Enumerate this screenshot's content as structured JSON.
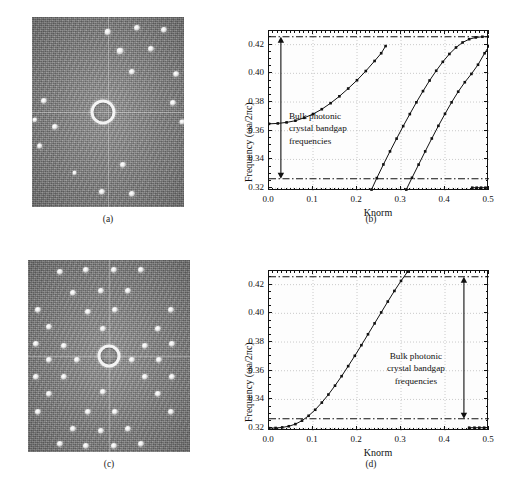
{
  "figure": {
    "panels": [
      {
        "id": "a",
        "caption": "(a)",
        "type": "micrograph"
      },
      {
        "id": "b",
        "caption": "(b)",
        "type": "chart"
      },
      {
        "id": "c",
        "caption": "(c)",
        "type": "micrograph"
      },
      {
        "id": "d",
        "caption": "(d)",
        "type": "chart"
      }
    ]
  },
  "micrograph_a": {
    "label": "(a)",
    "description": "grayscale near-field micrograph with sparse bright spots and central ring",
    "ring": {
      "cx": 47,
      "cy": 50,
      "r": 9.5
    },
    "spots": [
      {
        "x": 50,
        "y": 8,
        "r": 3.2
      },
      {
        "x": 69,
        "y": 6,
        "r": 3.0
      },
      {
        "x": 87,
        "y": 7,
        "r": 3.0
      },
      {
        "x": 58,
        "y": 18,
        "r": 3.2
      },
      {
        "x": 78,
        "y": 17,
        "r": 3.0
      },
      {
        "x": 66,
        "y": 29,
        "r": 3.0
      },
      {
        "x": 95,
        "y": 30,
        "r": 2.8
      },
      {
        "x": 8,
        "y": 44,
        "r": 3.0
      },
      {
        "x": 2,
        "y": 54,
        "r": 2.6
      },
      {
        "x": 15,
        "y": 58,
        "r": 3.0
      },
      {
        "x": 5,
        "y": 68,
        "r": 2.8
      },
      {
        "x": 93,
        "y": 45,
        "r": 3.0
      },
      {
        "x": 99,
        "y": 55,
        "r": 2.6
      },
      {
        "x": 60,
        "y": 78,
        "r": 3.0
      },
      {
        "x": 46,
        "y": 92,
        "r": 3.0
      },
      {
        "x": 66,
        "y": 93,
        "r": 3.0
      },
      {
        "x": 28,
        "y": 82,
        "r": 2.4
      }
    ]
  },
  "micrograph_c": {
    "label": "(c)",
    "description": "grayscale near-field micrograph with dense square lattice of bright spots and central ring",
    "ring": {
      "cx": 50,
      "cy": 50,
      "r": 8.5
    },
    "spots": [
      {
        "x": 20,
        "y": 6,
        "r": 3.0
      },
      {
        "x": 36,
        "y": 5,
        "r": 3.0
      },
      {
        "x": 53,
        "y": 5,
        "r": 3.0
      },
      {
        "x": 70,
        "y": 5,
        "r": 3.0
      },
      {
        "x": 28,
        "y": 17,
        "r": 3.0
      },
      {
        "x": 45,
        "y": 16,
        "r": 3.0
      },
      {
        "x": 62,
        "y": 16,
        "r": 3.0
      },
      {
        "x": 6,
        "y": 26,
        "r": 3.0
      },
      {
        "x": 37,
        "y": 27,
        "r": 3.0
      },
      {
        "x": 54,
        "y": 26,
        "r": 3.0
      },
      {
        "x": 88,
        "y": 26,
        "r": 3.0
      },
      {
        "x": 13,
        "y": 35,
        "r": 3.0
      },
      {
        "x": 46,
        "y": 36,
        "r": 3.0
      },
      {
        "x": 80,
        "y": 36,
        "r": 3.0
      },
      {
        "x": 5,
        "y": 44,
        "r": 3.0
      },
      {
        "x": 22,
        "y": 45,
        "r": 3.0
      },
      {
        "x": 72,
        "y": 45,
        "r": 3.0
      },
      {
        "x": 89,
        "y": 44,
        "r": 3.0
      },
      {
        "x": 13,
        "y": 52,
        "r": 3.0
      },
      {
        "x": 30,
        "y": 52,
        "r": 3.0
      },
      {
        "x": 64,
        "y": 52,
        "r": 3.0
      },
      {
        "x": 81,
        "y": 52,
        "r": 3.0
      },
      {
        "x": 5,
        "y": 61,
        "r": 3.0
      },
      {
        "x": 22,
        "y": 61,
        "r": 3.0
      },
      {
        "x": 72,
        "y": 61,
        "r": 3.0
      },
      {
        "x": 89,
        "y": 61,
        "r": 3.0
      },
      {
        "x": 13,
        "y": 70,
        "r": 3.0
      },
      {
        "x": 46,
        "y": 69,
        "r": 3.0
      },
      {
        "x": 80,
        "y": 70,
        "r": 3.0
      },
      {
        "x": 6,
        "y": 79,
        "r": 3.0
      },
      {
        "x": 37,
        "y": 79,
        "r": 3.0
      },
      {
        "x": 54,
        "y": 79,
        "r": 3.0
      },
      {
        "x": 88,
        "y": 79,
        "r": 3.0
      },
      {
        "x": 28,
        "y": 88,
        "r": 3.0
      },
      {
        "x": 45,
        "y": 89,
        "r": 3.0
      },
      {
        "x": 62,
        "y": 88,
        "r": 3.0
      },
      {
        "x": 20,
        "y": 96,
        "r": 3.0
      },
      {
        "x": 36,
        "y": 97,
        "r": 3.0
      },
      {
        "x": 53,
        "y": 97,
        "r": 3.0
      },
      {
        "x": 70,
        "y": 96,
        "r": 3.0
      }
    ]
  },
  "chart_b": {
    "type": "line",
    "title": "",
    "xlabel": "Knorm",
    "ylabel": "Frequency (ωa/2πc)",
    "xlim": [
      0.0,
      0.5
    ],
    "ylim": [
      0.318,
      0.4295
    ],
    "xticks": [
      0.0,
      0.1,
      0.2,
      0.3,
      0.4,
      0.5
    ],
    "xticklabels": [
      "0.0",
      "0.1",
      "0.2",
      "0.3",
      "0.4",
      "0.5"
    ],
    "yticks": [
      0.32,
      0.34,
      0.36,
      0.38,
      0.4,
      0.42
    ],
    "yticklabels": [
      "0.32",
      "0.34",
      "0.36",
      "0.38",
      "0.40",
      "0.42"
    ],
    "grid": true,
    "legend": "none",
    "bandgap": {
      "upper": 0.4255,
      "lower": 0.3265,
      "annotation": [
        "Bulk photonic",
        "crystal bandgap",
        "frequencies"
      ],
      "arrow_x": 0.027
    },
    "series": [
      {
        "name": "band-1",
        "marker": "square",
        "x": [
          0.0,
          0.02,
          0.04,
          0.06,
          0.08,
          0.1,
          0.12,
          0.14,
          0.16,
          0.18,
          0.2,
          0.22,
          0.24,
          0.255,
          0.265
        ],
        "y": [
          0.3648,
          0.3651,
          0.3658,
          0.367,
          0.369,
          0.3716,
          0.375,
          0.3792,
          0.384,
          0.3894,
          0.3952,
          0.4016,
          0.4086,
          0.414,
          0.419
        ]
      },
      {
        "name": "band-2",
        "marker": "square",
        "x": [
          0.233,
          0.245,
          0.26,
          0.275,
          0.29,
          0.305,
          0.32,
          0.335,
          0.35,
          0.365,
          0.38,
          0.395,
          0.41,
          0.425,
          0.44,
          0.455,
          0.47,
          0.485,
          0.5
        ],
        "y": [
          0.319,
          0.327,
          0.3365,
          0.3456,
          0.3545,
          0.3632,
          0.3716,
          0.3798,
          0.3876,
          0.395,
          0.4018,
          0.408,
          0.4135,
          0.418,
          0.4215,
          0.4238,
          0.425,
          0.4255,
          0.4256
        ]
      },
      {
        "name": "band-3",
        "marker": "square",
        "x": [
          0.312,
          0.325,
          0.34,
          0.355,
          0.37,
          0.385,
          0.4,
          0.415,
          0.43,
          0.445,
          0.46,
          0.475,
          0.49,
          0.5
        ],
        "y": [
          0.319,
          0.3272,
          0.3364,
          0.3456,
          0.3546,
          0.3634,
          0.3718,
          0.3798,
          0.3872,
          0.3938,
          0.3996,
          0.406,
          0.414,
          0.419
        ]
      },
      {
        "name": "band-4-flat",
        "marker": "square",
        "x": [
          0.462,
          0.472,
          0.482,
          0.492,
          0.5
        ],
        "y": [
          0.3203,
          0.3203,
          0.3203,
          0.3203,
          0.3203
        ]
      }
    ]
  },
  "chart_d": {
    "type": "line",
    "title": "",
    "xlabel": "Knorm",
    "ylabel": "Frequency (ωa/2πc)",
    "xlim": [
      0.0,
      0.5
    ],
    "ylim": [
      0.318,
      0.4295
    ],
    "xticks": [
      0.0,
      0.1,
      0.2,
      0.3,
      0.4,
      0.5
    ],
    "xticklabels": [
      "0.0",
      "0.1",
      "0.2",
      "0.3",
      "0.4",
      "0.5"
    ],
    "yticks": [
      0.32,
      0.34,
      0.36,
      0.38,
      0.4,
      0.42
    ],
    "yticklabels": [
      "0.32",
      "0.34",
      "0.36",
      "0.38",
      "0.40",
      "0.42"
    ],
    "grid": true,
    "legend": "none",
    "bandgap": {
      "upper": 0.4255,
      "lower": 0.3265,
      "annotation": [
        "Bulk photonic",
        "crystal bandgap",
        "frequencies"
      ],
      "arrow_x": 0.443
    },
    "series": [
      {
        "name": "defect-band",
        "marker": "square",
        "x": [
          0.0,
          0.015,
          0.03,
          0.045,
          0.06,
          0.075,
          0.09,
          0.105,
          0.12,
          0.135,
          0.15,
          0.165,
          0.18,
          0.195,
          0.21,
          0.225,
          0.24,
          0.255,
          0.27,
          0.285,
          0.3,
          0.315,
          0.33,
          0.34
        ],
        "y": [
          0.32,
          0.3201,
          0.3205,
          0.3213,
          0.3228,
          0.3252,
          0.3286,
          0.3328,
          0.3378,
          0.3434,
          0.3496,
          0.3562,
          0.3632,
          0.3704,
          0.3778,
          0.3854,
          0.393,
          0.4006,
          0.4082,
          0.4156,
          0.4226,
          0.429,
          0.434,
          0.4355
        ]
      },
      {
        "name": "flat-band",
        "marker": "square",
        "x": [
          0.455,
          0.467,
          0.478,
          0.489,
          0.5
        ],
        "y": [
          0.3203,
          0.3203,
          0.3203,
          0.3203,
          0.3203
        ]
      }
    ]
  }
}
